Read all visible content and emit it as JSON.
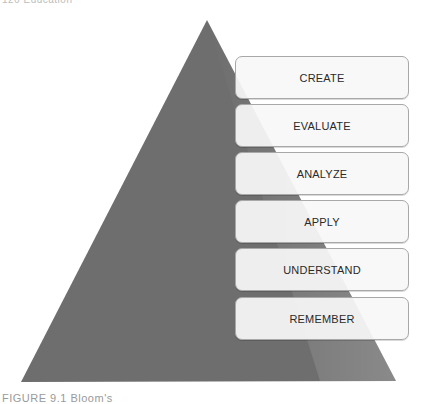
{
  "page": {
    "header_caption": "126   Education",
    "footer_caption": "FIGURE 9.1  Bloom's"
  },
  "diagram": {
    "type": "pyramid",
    "colors": {
      "pyramid_fill": "#6e6e6e",
      "box_fill": "#f8f8f8",
      "box_border": "#a8a8a8",
      "text": "#2a2a2a"
    },
    "levels": [
      {
        "label": "CREATE"
      },
      {
        "label": "EVALUATE"
      },
      {
        "label": "ANALYZE"
      },
      {
        "label": "APPLY"
      },
      {
        "label": "UNDERSTAND"
      },
      {
        "label": "REMEMBER"
      }
    ]
  }
}
